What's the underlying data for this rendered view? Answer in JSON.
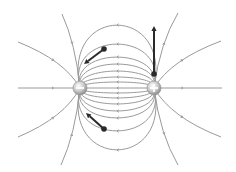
{
  "diagram": {
    "title": "Electric field lines of an electric dipole",
    "colors": {
      "background": "#ffffff",
      "field_line": "#9a9a9a",
      "vector": "#2a2a2a",
      "charge_fill": "#c8c8c8"
    },
    "charges": [
      {
        "id": "negative",
        "sign": "-",
        "label": "negative charge",
        "x": 80,
        "y": 88,
        "r": 7
      },
      {
        "id": "positive",
        "sign": "+",
        "label": "positive charge",
        "x": 154,
        "y": 88,
        "r": 7
      }
    ],
    "midline_crossings_y": [
      25,
      44,
      57,
      64,
      71,
      77,
      82,
      88,
      93,
      98,
      104,
      111,
      118,
      131,
      150
    ],
    "open_lines": [
      {
        "from": "negative",
        "to": [
          18,
          88
        ]
      },
      {
        "from": "negative",
        "to": [
          18,
          42
        ]
      },
      {
        "from": "negative",
        "to": [
          62,
          14
        ]
      },
      {
        "from": "negative",
        "to": [
          18,
          137
        ]
      },
      {
        "from": "negative",
        "to": [
          61,
          165
        ]
      },
      {
        "from": "positive",
        "to": [
          222,
          88
        ]
      },
      {
        "from": "positive",
        "to": [
          221,
          41
        ]
      },
      {
        "from": "positive",
        "to": [
          178,
          13
        ]
      },
      {
        "from": "positive",
        "to": [
          221,
          137
        ]
      },
      {
        "from": "positive",
        "to": [
          178,
          165
        ]
      }
    ],
    "field_vectors": [
      {
        "label": "field vector upper-left",
        "tail": [
          104,
          49
        ],
        "head": [
          84,
          64
        ]
      },
      {
        "label": "field vector vertical",
        "tail": [
          154,
          74
        ],
        "head": [
          154,
          26
        ]
      },
      {
        "label": "field vector lower-left",
        "tail": [
          104,
          129
        ],
        "head": [
          86,
          113
        ]
      }
    ]
  }
}
